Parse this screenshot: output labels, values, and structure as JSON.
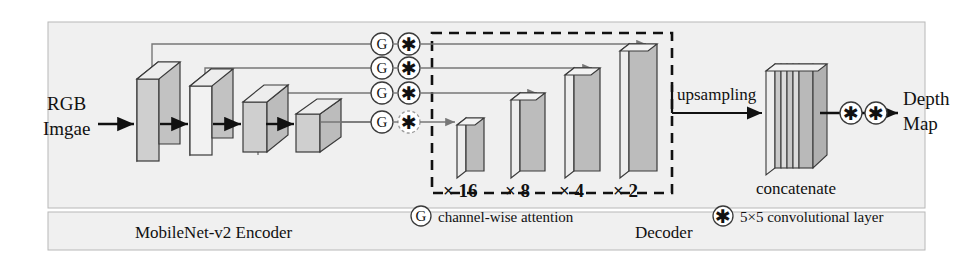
{
  "figure": {
    "type": "diagram"
  },
  "io": {
    "input_line1": "RGB",
    "input_line2": "Imgae",
    "output_line1": "Depth",
    "output_line2": "Map"
  },
  "encoder": {
    "section_label": "MobileNet-v2 Encoder",
    "blocks": [
      {
        "name": "encoder-block-1"
      },
      {
        "name": "encoder-block-2"
      },
      {
        "name": "encoder-block-3"
      },
      {
        "name": "encoder-block-4"
      }
    ]
  },
  "skip_connections": {
    "count": 4,
    "attention_glyph": "G",
    "conv_glyph": "✱"
  },
  "decoder": {
    "section_label": "Decoder",
    "blocks": [
      {
        "label": "× 16"
      },
      {
        "label": "× 8"
      },
      {
        "label": "× 4"
      },
      {
        "label": "× 2"
      }
    ]
  },
  "flow": {
    "upsampling": "upsampling",
    "concatenate": "concatenate"
  },
  "legend": [
    {
      "glyph": "G",
      "text": "channel-wise attention"
    },
    {
      "glyph": "✱",
      "text": "5×5 convolutional layer"
    }
  ],
  "colors": {
    "face_light": "#f2f2f2",
    "face_mid": "#c9c9c9",
    "face_dark": "#b3b3b3",
    "stroke": "#3a3a3a",
    "skip_line": "#777777",
    "background": "#ffffff",
    "panel": "#f0f0f0"
  }
}
